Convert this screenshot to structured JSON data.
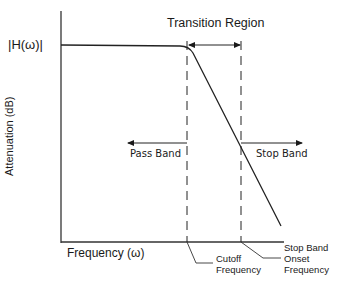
{
  "diagram": {
    "magnitude_label": "|H(ω)|",
    "y_axis_label": "Attenuation (dB)",
    "x_axis_label": "Frequency (ω)",
    "transition_label": "Transition Region",
    "pass_band_label": "Pass Band",
    "stop_band_label": "Stop Band",
    "cutoff_label_line1": "Cutoff",
    "cutoff_label_line2": "Frequency",
    "onset_label_line1": "Stop Band",
    "onset_label_line2": "Onset",
    "onset_label_line3": "Frequency"
  },
  "colors": {
    "line": "#1a1a1a",
    "background": "#ffffff"
  }
}
